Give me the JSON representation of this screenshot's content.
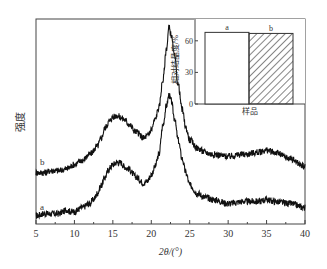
{
  "chart_data": [
    {
      "type": "line",
      "title": "",
      "xlabel": "2θ/(°)",
      "ylabel": "强度",
      "xlim": [
        5,
        40
      ],
      "ylim": [
        0,
        100
      ],
      "xticks": [
        5,
        10,
        15,
        20,
        25,
        30,
        35,
        40
      ],
      "yticks": [],
      "grid": false,
      "series": [
        {
          "name": "a",
          "x": [
            5,
            6,
            7,
            8,
            8.5,
            9,
            9.5,
            10,
            11,
            12,
            12.5,
            13,
            13.5,
            14,
            14.5,
            15,
            15.5,
            16,
            16.5,
            17,
            18,
            19,
            19.5,
            20,
            20.5,
            21,
            21.5,
            22,
            22.3,
            22.6,
            23,
            23.5,
            24,
            24.5,
            25,
            26,
            27,
            28,
            30,
            32,
            34,
            35,
            36,
            38,
            40
          ],
          "y": [
            4,
            5,
            5,
            5,
            6,
            7,
            6,
            6,
            8,
            10,
            12,
            15,
            19,
            23,
            27,
            29,
            30,
            30,
            28,
            27,
            23,
            20,
            21,
            24,
            28,
            34,
            48,
            58,
            63,
            60,
            52,
            41,
            32,
            25,
            19,
            15,
            13,
            12,
            10,
            11,
            11,
            12,
            11,
            10,
            8
          ]
        },
        {
          "name": "b",
          "x": [
            5,
            6,
            7,
            8,
            9,
            10,
            11,
            12,
            13,
            13.5,
            14,
            14.5,
            15,
            15.5,
            16,
            16.5,
            17,
            18,
            19,
            19.5,
            20,
            20.5,
            21,
            21.5,
            22,
            22.3,
            22.6,
            23,
            23.5,
            24,
            24.5,
            25,
            26,
            27,
            28,
            30,
            32,
            34,
            35,
            36,
            38,
            40
          ],
          "y": [
            25,
            25,
            26,
            26,
            27,
            29,
            31,
            34,
            38,
            42,
            47,
            50,
            52,
            53,
            52,
            51,
            49,
            45,
            42,
            43,
            46,
            51,
            57,
            70,
            86,
            96,
            92,
            82,
            68,
            56,
            47,
            41,
            37,
            35,
            34,
            33,
            34,
            35,
            36,
            35,
            32,
            28
          ]
        }
      ],
      "annotations": [
        "a",
        "b"
      ]
    },
    {
      "type": "bar",
      "title": "",
      "xlabel": "样品",
      "ylabel": "相对结晶度/%",
      "categories": [
        "a",
        "b"
      ],
      "values": [
        68,
        67
      ],
      "ylim": [
        0,
        75
      ],
      "yticks": [
        0,
        30,
        60
      ],
      "patterns": [
        "none",
        "diagonal-hatch"
      ],
      "legend": "inset top-right"
    }
  ]
}
